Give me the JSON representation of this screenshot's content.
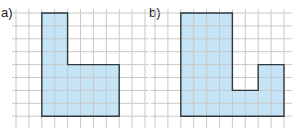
{
  "diagrams": [
    {
      "label": "a)",
      "shape": "L-shape",
      "grid": {
        "origin_x": 16,
        "origin_y": 13,
        "cols": 10,
        "rows": 9
      },
      "polygon_cells": [
        [
          2,
          0
        ],
        [
          4,
          0
        ],
        [
          4,
          4
        ],
        [
          8,
          4
        ],
        [
          8,
          8
        ],
        [
          2,
          8
        ]
      ]
    },
    {
      "label": "b)",
      "shape": "U-shape (stepped)",
      "grid": {
        "origin_x": 155,
        "origin_y": 13,
        "cols": 11,
        "rows": 9
      },
      "polygon_cells": [
        [
          2,
          0
        ],
        [
          6,
          0
        ],
        [
          6,
          6
        ],
        [
          8,
          6
        ],
        [
          8,
          4
        ],
        [
          10,
          4
        ],
        [
          10,
          8
        ],
        [
          2,
          8
        ]
      ]
    }
  ],
  "style": {
    "cell_size": 12.9,
    "grid_line_color": "#c8c8c8",
    "fill_color": "#c5e4f5",
    "outline_color": "#2e3a40"
  }
}
